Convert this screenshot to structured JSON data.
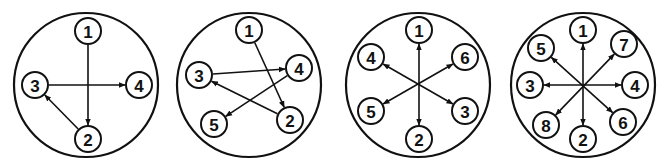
{
  "diagrams": [
    {
      "id": "diagram-1",
      "outer": {
        "cx": 86,
        "cy": 85,
        "r": 72
      },
      "nodes": [
        {
          "label": "1",
          "x": 88,
          "y": 31
        },
        {
          "label": "2",
          "x": 88,
          "y": 139
        },
        {
          "label": "3",
          "x": 35,
          "y": 85
        },
        {
          "label": "4",
          "x": 139,
          "y": 85
        }
      ],
      "edges": [
        {
          "from": "1",
          "to": "2",
          "arrow_end": true,
          "arrow_start": false
        },
        {
          "from": "3",
          "to": "4",
          "arrow_end": true,
          "arrow_start": false
        },
        {
          "from": "2",
          "to": "3",
          "arrow_end": true,
          "arrow_start": false
        }
      ]
    },
    {
      "id": "diagram-2",
      "outer": {
        "cx": 249,
        "cy": 85,
        "r": 72
      },
      "nodes": [
        {
          "label": "1",
          "x": 249,
          "y": 30
        },
        {
          "label": "2",
          "x": 290,
          "y": 120
        },
        {
          "label": "3",
          "x": 199,
          "y": 75
        },
        {
          "label": "4",
          "x": 299,
          "y": 68
        },
        {
          "label": "5",
          "x": 214,
          "y": 124
        }
      ],
      "edges": [
        {
          "from": "1",
          "to": "2",
          "arrow_end": true,
          "arrow_start": false
        },
        {
          "from": "3",
          "to": "4",
          "arrow_end": true,
          "arrow_start": false
        },
        {
          "from": "2",
          "to": "3",
          "arrow_end": true,
          "arrow_start": false
        },
        {
          "from": "4",
          "to": "5",
          "arrow_end": true,
          "arrow_start": false
        }
      ]
    },
    {
      "id": "diagram-3",
      "outer": {
        "cx": 418,
        "cy": 85,
        "r": 72
      },
      "nodes": [
        {
          "label": "1",
          "x": 419,
          "y": 30
        },
        {
          "label": "2",
          "x": 419,
          "y": 139
        },
        {
          "label": "3",
          "x": 465,
          "y": 111
        },
        {
          "label": "4",
          "x": 371,
          "y": 57
        },
        {
          "label": "5",
          "x": 371,
          "y": 111
        },
        {
          "label": "6",
          "x": 465,
          "y": 57
        }
      ],
      "edges": [
        {
          "from": "1",
          "to": "2",
          "arrow_end": true,
          "arrow_start": true
        },
        {
          "from": "4",
          "to": "3",
          "arrow_end": true,
          "arrow_start": true
        },
        {
          "from": "5",
          "to": "6",
          "arrow_end": true,
          "arrow_start": true
        }
      ]
    },
    {
      "id": "diagram-4",
      "outer": {
        "cx": 583,
        "cy": 85,
        "r": 72
      },
      "nodes": [
        {
          "label": "1",
          "x": 583,
          "y": 30
        },
        {
          "label": "2",
          "x": 583,
          "y": 139
        },
        {
          "label": "3",
          "x": 530,
          "y": 85
        },
        {
          "label": "4",
          "x": 635,
          "y": 85
        },
        {
          "label": "5",
          "x": 541,
          "y": 48
        },
        {
          "label": "6",
          "x": 623,
          "y": 122
        },
        {
          "label": "7",
          "x": 624,
          "y": 44
        },
        {
          "label": "8",
          "x": 546,
          "y": 125
        }
      ],
      "edges": [
        {
          "from": "1",
          "to": "2",
          "arrow_end": true,
          "arrow_start": true
        },
        {
          "from": "3",
          "to": "4",
          "arrow_end": true,
          "arrow_start": true
        },
        {
          "from": "5",
          "to": "6",
          "arrow_end": true,
          "arrow_start": true
        },
        {
          "from": "7",
          "to": "8",
          "arrow_end": true,
          "arrow_start": true
        }
      ]
    }
  ],
  "style": {
    "stroke": "#111111",
    "background": "#ffffff",
    "node_radius": 13
  }
}
